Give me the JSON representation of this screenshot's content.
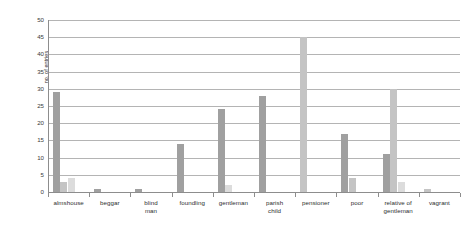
{
  "chart_data": {
    "type": "bar",
    "title": "",
    "subtitle": "",
    "xlabel": "",
    "ylabel": "no. of entries",
    "ylim": [
      0,
      50
    ],
    "ytick_step": 5,
    "yticks": [
      0,
      5,
      10,
      15,
      20,
      25,
      30,
      35,
      40,
      45,
      50
    ],
    "ytick_labels": [
      "0",
      "5",
      "10",
      "15",
      "20",
      "25",
      "30",
      "35",
      "40",
      "45",
      "50"
    ],
    "grid": true,
    "grid_axis": "y",
    "legend": false,
    "legend_position": "none",
    "categories": [
      "almshouse",
      "beggar",
      "blind man",
      "foundling",
      "gentleman",
      "parish child",
      "pensioner",
      "poor",
      "relative of gentleman",
      "vagrant"
    ],
    "category_labels_multiline": [
      [
        "almshouse"
      ],
      [
        "beggar"
      ],
      [
        "blind",
        "man"
      ],
      [
        "foundling"
      ],
      [
        "gentleman"
      ],
      [
        "parish",
        "child"
      ],
      [
        "pensioner"
      ],
      [
        "poor"
      ],
      [
        "relative of",
        "gentleman"
      ],
      [
        "vagrant"
      ]
    ],
    "series": [
      {
        "name": "series-1",
        "color": "#a0a0a0",
        "values": [
          29,
          1,
          1,
          14,
          24,
          28,
          0,
          17,
          11,
          0
        ]
      },
      {
        "name": "series-2",
        "color": "#c4c4c4",
        "values": [
          3,
          0,
          0,
          0,
          0,
          0,
          45,
          4,
          30,
          1
        ]
      },
      {
        "name": "series-3",
        "color": "#dcdcdc",
        "values": [
          4,
          0,
          0,
          0,
          2,
          0,
          0,
          0,
          3,
          0
        ]
      }
    ],
    "colors": {
      "bar_dark": "#a0a0a0",
      "bar_medium": "#c4c4c4",
      "bar_light": "#dcdcdc",
      "gridline": "#b4b4b4",
      "axis": "#8d8d8d",
      "text": "#2e2e2e",
      "background": "#ffffff"
    }
  }
}
